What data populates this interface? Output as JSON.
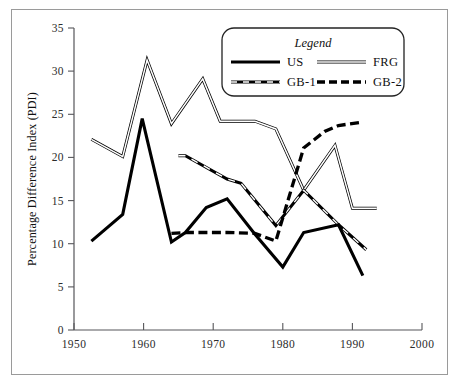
{
  "chart_data": {
    "type": "line",
    "title": "",
    "xlabel": "",
    "ylabel": "Percentage Difference Index (PDI)",
    "xlim": [
      1950,
      2000
    ],
    "ylim": [
      0,
      35
    ],
    "xticks": [
      "1950",
      "1960",
      "1970",
      "1980",
      "1990",
      "2000"
    ],
    "yticks": [
      "0",
      "5",
      "10",
      "15",
      "20",
      "25",
      "30",
      "35"
    ],
    "grid": false,
    "legend": {
      "title": "Legend",
      "position": "top-right",
      "entries": [
        {
          "name": "US",
          "style": "solid-thick-black"
        },
        {
          "name": "FRG",
          "style": "double-thin-outline"
        },
        {
          "name": "GB-1",
          "style": "dashed-outline"
        },
        {
          "name": "GB-2",
          "style": "dashed-thick-black"
        }
      ]
    },
    "series": [
      {
        "name": "US",
        "x": [
          1952.5,
          1957,
          1959.8,
          1964,
          1966,
          1969,
          1972,
          1976,
          1980,
          1983,
          1988,
          1991.5
        ],
        "y": [
          10.3,
          13.4,
          24.5,
          10.2,
          11.3,
          14.2,
          15.2,
          11.1,
          7.3,
          11.3,
          12.2,
          6.3
        ]
      },
      {
        "name": "FRG",
        "x": [
          1952.5,
          1957,
          1960.5,
          1964,
          1968.5,
          1971,
          1976,
          1979,
          1983,
          1987.5,
          1990,
          1993.5
        ],
        "y": [
          22.1,
          20.1,
          31.3,
          23.9,
          29.1,
          24.2,
          24.2,
          23.3,
          16.2,
          21.4,
          14.1,
          14.1
        ]
      },
      {
        "name": "GB-1",
        "x": [
          1965,
          1966,
          1972,
          1974,
          1979,
          1983,
          1988,
          1992
        ],
        "y": [
          20.2,
          20.2,
          17.5,
          17.0,
          12.1,
          16.2,
          12.2,
          9.3
        ]
      },
      {
        "name": "GB-2",
        "x": [
          1964,
          1966,
          1972,
          1976,
          1979,
          1983,
          1986,
          1988,
          1991.5
        ],
        "y": [
          11.2,
          11.3,
          11.3,
          11.2,
          10.3,
          21.1,
          23.0,
          23.7,
          24.1
        ]
      }
    ]
  },
  "colors": {
    "ink": "#000000",
    "axis": "#56565a",
    "frame": "#9a9a9a",
    "paper": "#ffffff"
  }
}
